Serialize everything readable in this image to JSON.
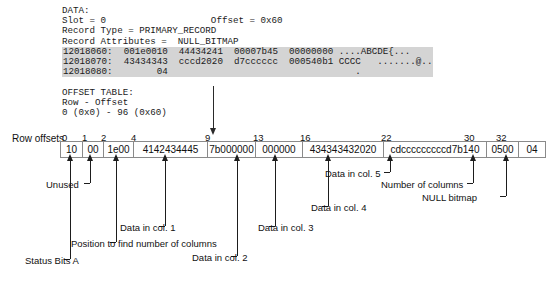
{
  "dump": {
    "lines": [
      {
        "text": "DATA:",
        "hl": false
      },
      {
        "text": "Slot = 0                   Offset = 0x60",
        "hl": false
      },
      {
        "text": "Record Type = PRIMARY_RECORD",
        "hl": false
      },
      {
        "text": "Record Attributes =  NULL_BITMAP",
        "hl": false
      },
      {
        "text": "12018060:  001e0010  44434241  00007b45  00000000 ....ABCDE{...",
        "hl": true
      },
      {
        "text": "12018070:  43434343  cccd2020  d7cccccc  000540b1 CCCC   .......@..",
        "hl": true
      },
      {
        "text": "12018080:        04                                  .",
        "hl": true
      },
      {
        "text": "",
        "hl": false
      },
      {
        "text": "OFFSET TABLE:",
        "hl": false
      },
      {
        "text": "Row - Offset",
        "hl": false
      },
      {
        "text": "0 (0x0) - 96 (0x60)",
        "hl": false
      }
    ]
  },
  "ruler": {
    "label": "Row offsets",
    "ticks": [
      {
        "value": "0",
        "x": 62
      },
      {
        "value": "1",
        "x": 82
      },
      {
        "value": "2",
        "x": 101
      },
      {
        "value": "4",
        "x": 131
      },
      {
        "value": "9",
        "x": 205
      },
      {
        "value": "13",
        "x": 253
      },
      {
        "value": "16",
        "x": 300
      },
      {
        "value": "22",
        "x": 381
      },
      {
        "value": "30",
        "x": 464
      },
      {
        "value": "32",
        "x": 496
      }
    ]
  },
  "bytes": {
    "cells": [
      {
        "value": "10",
        "w": 22
      },
      {
        "value": "00",
        "w": 21
      },
      {
        "value": "1e00",
        "w": 30
      },
      {
        "value": "4142434445",
        "w": 74
      },
      {
        "value": "7b000000",
        "w": 48
      },
      {
        "value": "000000",
        "w": 47
      },
      {
        "value": "434343432020",
        "w": 81
      },
      {
        "value": "cdcccccccccd7b140",
        "w": 103
      },
      {
        "value": "0500",
        "w": 32
      },
      {
        "value": "04",
        "w": 26
      }
    ]
  },
  "callouts": [
    {
      "name": "status-bits-a",
      "label": "Status Bits A",
      "arrow_x": 70,
      "arrow_top": 160,
      "arrow_h": 26,
      "leader_top": 186,
      "leader_h": 73,
      "text_x": 25,
      "text_y": 255,
      "foot_w": 6
    },
    {
      "name": "unused",
      "label": "Unused",
      "arrow_x": 90,
      "arrow_top": 160,
      "arrow_h": 23,
      "leader_top": 183,
      "leader_h": 0,
      "text_x": 46,
      "text_y": 179,
      "foot_w": 6
    },
    {
      "name": "position-number-of-columns",
      "label": "Position to find number of columns",
      "arrow_x": 116,
      "arrow_top": 160,
      "arrow_h": 26,
      "leader_top": 186,
      "leader_h": 56,
      "text_x": 71,
      "text_y": 238,
      "foot_w": 6
    },
    {
      "name": "data-in-col-1",
      "label": "Data in col. 1",
      "arrow_x": 165,
      "arrow_top": 160,
      "arrow_h": 26,
      "leader_top": 186,
      "leader_h": 40,
      "text_x": 120,
      "text_y": 222,
      "foot_w": 6
    },
    {
      "name": "data-in-col-2",
      "label": "Data in col. 2",
      "arrow_x": 237,
      "arrow_top": 160,
      "arrow_h": 26,
      "leader_top": 186,
      "leader_h": 70,
      "text_x": 192,
      "text_y": 252,
      "foot_w": 6
    },
    {
      "name": "data-in-col-3",
      "label": "Data in col. 3",
      "arrow_x": 275,
      "arrow_top": 160,
      "arrow_h": 26,
      "leader_top": 186,
      "leader_h": 40,
      "text_x": 258,
      "text_y": 222,
      "foot_w": 6
    },
    {
      "name": "data-in-col-4",
      "label": "Data in col. 4",
      "arrow_x": 328,
      "arrow_top": 160,
      "arrow_h": 26,
      "leader_top": 186,
      "leader_h": 20,
      "text_x": 311,
      "text_y": 202,
      "foot_w": 6
    },
    {
      "name": "data-in-col-5",
      "label": "Data in col. 5",
      "arrow_x": 390,
      "arrow_top": 160,
      "arrow_h": 12,
      "leader_top": 172,
      "leader_h": 0,
      "text_x": 325,
      "text_y": 168,
      "foot_w": 6
    },
    {
      "name": "number-of-columns",
      "label": "Number of columns",
      "arrow_x": 473,
      "arrow_top": 160,
      "arrow_h": 23,
      "leader_top": 183,
      "leader_h": 0,
      "text_x": 381,
      "text_y": 179,
      "foot_w": 6
    },
    {
      "name": "null-bitmap",
      "label": "NULL bitmap",
      "arrow_x": 506,
      "arrow_top": 160,
      "arrow_h": 36,
      "leader_top": 196,
      "leader_h": 0,
      "text_x": 422,
      "text_y": 192,
      "foot_w": 6
    }
  ]
}
